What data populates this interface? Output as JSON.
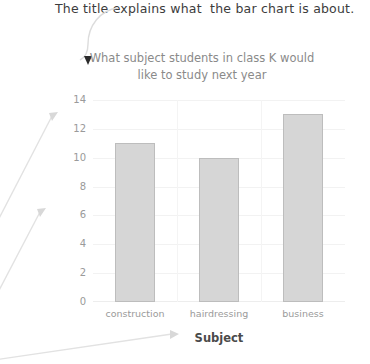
{
  "annotation": {
    "text": "The title explains what  the bar chart is about."
  },
  "chart_data": {
    "type": "bar",
    "title": "What subject students in class K would like to study next year",
    "title_line1": "What subject students in class K would",
    "title_line2": "like to study next year",
    "xlabel": "Subject",
    "ylabel": "Number of students",
    "categories": [
      "construction",
      "hairdressing",
      "business"
    ],
    "values": [
      11,
      10,
      13
    ],
    "yticks": [
      0,
      2,
      4,
      6,
      8,
      10,
      12,
      14
    ],
    "ylim": [
      0,
      14
    ],
    "grid": true,
    "legend": false,
    "bar_color": "#d6d6d6",
    "bar_border_color": "#bdbdbd",
    "title_color": "#8a8a8a",
    "tick_color": "#9a9a9a",
    "axis_label_color": "#4a4a4a",
    "annotation_color": "#3c3c3c",
    "callout_color": "#dadada"
  }
}
